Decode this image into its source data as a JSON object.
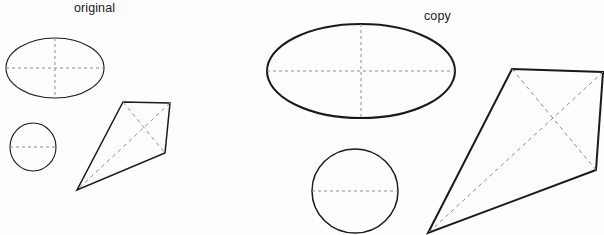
{
  "figure": {
    "width": 604,
    "height": 235,
    "background_color": "#fdfdfd",
    "outline_color": "#1a1a1a",
    "dash_color": "#8d8d8d",
    "labels": {
      "original": "original",
      "copy": "copy"
    },
    "scan_remnant_text": "",
    "groups": [
      {
        "name": "original",
        "label": "original",
        "label_x": 74,
        "label_y": 1,
        "shapes": [
          {
            "name": "ellipse-original",
            "type": "ellipse",
            "cx": 55,
            "cy": 68,
            "rx": 49,
            "ry": 30,
            "stroke_width": 1.1,
            "axes": [
              {
                "name": "horizontal-axis",
                "x1": 6,
                "y1": 68,
                "x2": 104,
                "y2": 68
              },
              {
                "name": "vertical-axis",
                "x1": 55,
                "y1": 38,
                "x2": 55,
                "y2": 98
              }
            ]
          },
          {
            "name": "circle-original",
            "type": "ellipse",
            "cx": 33,
            "cy": 147,
            "rx": 23,
            "ry": 24,
            "stroke_width": 1.1,
            "axes": [
              {
                "name": "horizontal-axis",
                "x1": 10,
                "y1": 147,
                "x2": 56,
                "y2": 147
              }
            ]
          },
          {
            "name": "kite-original",
            "type": "polygon",
            "stroke_width": 1.5,
            "points": [
              [
                123,
                102
              ],
              [
                170,
                103
              ],
              [
                165,
                153
              ],
              [
                77,
                190
              ]
            ],
            "diagonals": [
              {
                "name": "diagonal-a",
                "from": 0,
                "to": 2
              },
              {
                "name": "diagonal-b",
                "from": 1,
                "to": 3
              }
            ]
          }
        ]
      },
      {
        "name": "copy",
        "label": "copy",
        "label_x": 424,
        "label_y": 9,
        "shapes": [
          {
            "name": "ellipse-copy",
            "type": "ellipse",
            "cx": 361,
            "cy": 71,
            "rx": 94,
            "ry": 47,
            "stroke_width": 2.0,
            "axes": [
              {
                "name": "horizontal-axis",
                "x1": 267,
                "y1": 71,
                "x2": 455,
                "y2": 71
              },
              {
                "name": "vertical-axis",
                "x1": 361,
                "y1": 24,
                "x2": 361,
                "y2": 118
              }
            ]
          },
          {
            "name": "circle-copy",
            "type": "ellipse",
            "cx": 355,
            "cy": 191,
            "rx": 43,
            "ry": 42,
            "stroke_width": 1.5,
            "axes": [
              {
                "name": "horizontal-axis",
                "x1": 312,
                "y1": 191,
                "x2": 398,
                "y2": 191
              }
            ]
          },
          {
            "name": "kite-copy",
            "type": "polygon",
            "stroke_width": 2.0,
            "points": [
              [
                512,
                69
              ],
              [
                603,
                72
              ],
              [
                596,
                170
              ],
              [
                428,
                233
              ]
            ],
            "diagonals": [
              {
                "name": "diagonal-a",
                "from": 0,
                "to": 2
              },
              {
                "name": "diagonal-b",
                "from": 1,
                "to": 3
              }
            ]
          }
        ]
      }
    ]
  }
}
